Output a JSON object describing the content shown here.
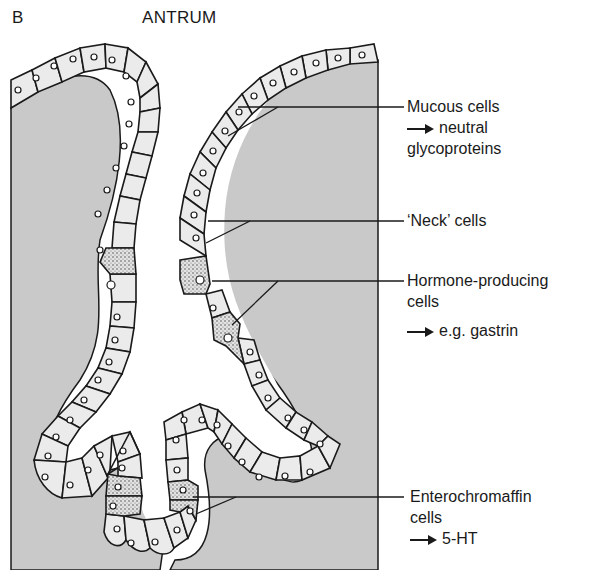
{
  "figure": {
    "panel_letter": "B",
    "title": "ANTRUM"
  },
  "labels": [
    {
      "id": "mucous",
      "lines": [
        "Mucous cells"
      ],
      "arrow_text": "neutral",
      "extra_line": "glycoproteins"
    },
    {
      "id": "neck",
      "lines": [
        "‘Neck’ cells"
      ]
    },
    {
      "id": "hormone",
      "lines": [
        "Hormone-producing",
        "cells"
      ],
      "arrow_text": "e.g. gastrin"
    },
    {
      "id": "enterochromaffin",
      "lines": [
        "Enterochromaffin",
        "cells"
      ],
      "arrow_text": "5-HT"
    }
  ],
  "colors": {
    "lamina_propria": "#c9c9c9",
    "cell_fill": "#ebebeb",
    "endocrine_fill": "#b8b8b8",
    "outline": "#1a1a1a"
  }
}
